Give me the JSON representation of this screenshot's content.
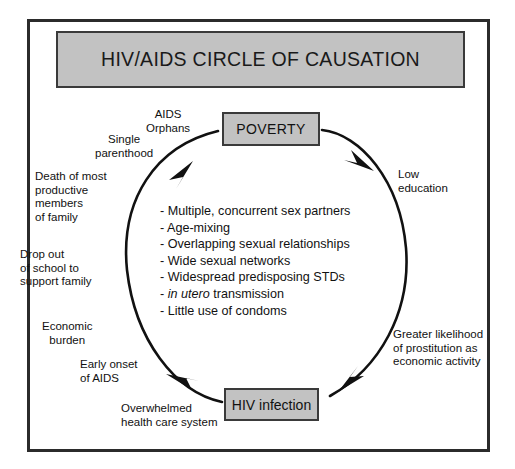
{
  "title": {
    "text": "HIV/AIDS CIRCLE OF CAUSATION"
  },
  "nodes": {
    "poverty": "POVERTY",
    "hiv_infection": "HIV infection"
  },
  "labels": [
    {
      "id": "aids-orphans",
      "text": "AIDS\nOrphans"
    },
    {
      "id": "single-parenthood",
      "text": "Single\nparenthood"
    },
    {
      "id": "death-productive",
      "text": "Death of most\nproductive\n members\nof family"
    },
    {
      "id": "drop-out-school",
      "text": "Drop out\nof school to\nsupport family"
    },
    {
      "id": "economic-burden",
      "text": "Economic\nburden"
    },
    {
      "id": "early-onset-aids",
      "text": "Early onset\nof AIDS"
    },
    {
      "id": "overwhelmed-health",
      "text": "Overwhelmed\nhealth care system"
    },
    {
      "id": "low-education",
      "text": "Low\neducation"
    },
    {
      "id": "greater-prostitution",
      "text": "Greater likelihood\nof prostitution as\neconomic activity"
    }
  ],
  "center_list": {
    "bullet": "-",
    "items": [
      {
        "pre": "Multiple, concurrent sex partners",
        "italic": "",
        "post": ""
      },
      {
        "pre": "Age-mixing",
        "italic": "",
        "post": ""
      },
      {
        "pre": "Overlapping sexual relationships",
        "italic": "",
        "post": ""
      },
      {
        "pre": "Wide sexual networks",
        "italic": "",
        "post": ""
      },
      {
        "pre": "Widespread predisposing STDs",
        "italic": "",
        "post": ""
      },
      {
        "pre": "",
        "italic": "in utero",
        "post": " transmission"
      },
      {
        "pre": "Little use of condoms",
        "italic": "",
        "post": ""
      }
    ]
  },
  "circle": {
    "direction": "clockwise",
    "center_x": 266,
    "center_y": 266,
    "radius": 140
  },
  "colors": {
    "box_fill": "#c2c2c2",
    "box_border": "#3a3a3a",
    "frame_border": "#2b2b2b",
    "text": "#111111",
    "arrow": "#111111",
    "background": "#ffffff"
  }
}
